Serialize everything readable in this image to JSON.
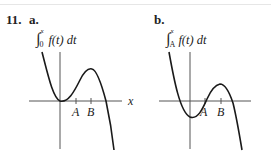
{
  "problem": {
    "number": "11.",
    "parts": [
      {
        "label": "a.",
        "expression": "f(t) dt",
        "lower": "0",
        "upper": "x",
        "axis_label": "x",
        "ticks": [
          "A",
          "B"
        ]
      },
      {
        "label": "b.",
        "expression": "f(t) dt",
        "lower": "A",
        "upper": "x",
        "axis_label": "",
        "ticks": [
          "A",
          "B"
        ]
      }
    ]
  },
  "colors": {
    "curve": "#1a1a1a",
    "axis": "#555555"
  }
}
